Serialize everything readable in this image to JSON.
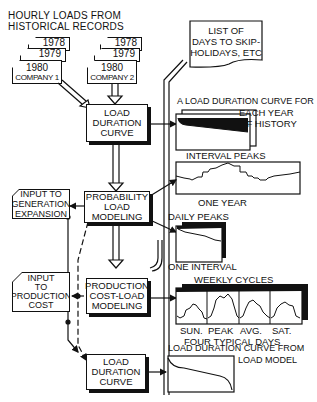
{
  "title": {
    "line1": "HOURLY LOADS FROM",
    "line2": "HISTORICAL RECORDS"
  },
  "company1": {
    "years": [
      "1978",
      "1979",
      "1980"
    ],
    "name": "COMPANY 1"
  },
  "company2": {
    "years": [
      "1978",
      "1979",
      "1980"
    ],
    "name": "COMPANY 2"
  },
  "skip_list": {
    "line1": "LIST OF",
    "line2": "DAYS TO SKIP-",
    "line3": "HOLIDAYS, ETC"
  },
  "boxes": {
    "load_duration_1": {
      "line1": "LOAD",
      "line2": "DURATION",
      "line3": "CURVE"
    },
    "probability": {
      "line1": "PROBABILITY",
      "line2": "LOAD",
      "line3": "MODELING"
    },
    "production": {
      "line1": "PRODUCTION",
      "line2": "COST-LOAD",
      "line3": "MODELING"
    },
    "load_duration_2": {
      "line1": "LOAD",
      "line2": "DURATION",
      "line3": "CURVE"
    },
    "gen_expansion": {
      "line1": "INPUT TO",
      "line2": "GENERATION",
      "line3": "EXPANSION"
    },
    "prod_cost": {
      "line1": "INPUT",
      "line2": "TO",
      "line3": "PRODUCTION",
      "line4": "COST"
    }
  },
  "charts": {
    "ldc_history": {
      "caption_line1": "A LOAD DURATION CURVE FOR",
      "caption_line2": "EACH YEAR",
      "caption_line3": "OF HISTORY"
    },
    "interval_peaks": {
      "title": "INTERVAL PEAKS",
      "xlabel": "ONE YEAR"
    },
    "daily_peaks": {
      "title": "DAILY PEAKS",
      "xlabel": "ONE INTERVAL"
    },
    "weekly_cycles": {
      "title": "WEEKLY CYCLES",
      "days": [
        "SUN.",
        "PEAK",
        "AVG.",
        "SAT."
      ],
      "xlabel": "FOUR TYPICAL DAYS"
    },
    "ldc_model": {
      "caption_line1": "LOAD DURATION CURVE FROM",
      "caption_line2": "LOAD MODEL"
    }
  }
}
